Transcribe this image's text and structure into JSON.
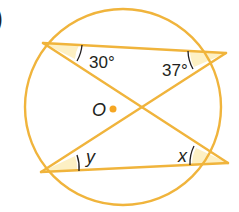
{
  "panel_marker": ")",
  "colors": {
    "line": "#f0b43c",
    "shade": "#fdf0c4",
    "center_dot": "#f5a623",
    "text": "#231f20",
    "background": "#ffffff"
  },
  "circle": {
    "cx": 123,
    "cy": 107,
    "r": 98
  },
  "center": {
    "label": "O",
    "x": 113,
    "y": 109
  },
  "points": {
    "A": {
      "x": 43,
      "y": 43
    },
    "B": {
      "x": 226,
      "y": 53
    },
    "C": {
      "x": 41,
      "y": 172
    },
    "D": {
      "x": 228,
      "y": 163
    }
  },
  "chords": [
    {
      "from": "A",
      "to": "B"
    },
    {
      "from": "A",
      "to": "D"
    },
    {
      "from": "B",
      "to": "C"
    },
    {
      "from": "C",
      "to": "D"
    }
  ],
  "angles": [
    {
      "at": "A",
      "label": "30°"
    },
    {
      "at": "B",
      "label": "37°"
    },
    {
      "at": "C",
      "label": "y"
    },
    {
      "at": "D",
      "label": "x"
    }
  ]
}
